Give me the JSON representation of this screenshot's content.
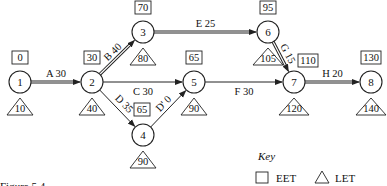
{
  "diagram": {
    "type": "activity-on-arrow network",
    "nodes": [
      {
        "id": "1",
        "label": "1",
        "eet": "0",
        "let": "10",
        "x": 20,
        "y": 82
      },
      {
        "id": "2",
        "label": "2",
        "eet": "30",
        "let": "40",
        "x": 92,
        "y": 82
      },
      {
        "id": "3",
        "label": "3",
        "eet": "70",
        "let": "80",
        "x": 143,
        "y": 32
      },
      {
        "id": "4",
        "label": "4",
        "eet": "65",
        "let": "90",
        "x": 143,
        "y": 135
      },
      {
        "id": "5",
        "label": "5",
        "eet": "65",
        "let": "90",
        "x": 194,
        "y": 82
      },
      {
        "id": "6",
        "label": "6",
        "eet": "95",
        "let": "105",
        "x": 268,
        "y": 32
      },
      {
        "id": "7",
        "label": "7",
        "eet": "110",
        "let": "120",
        "x": 294,
        "y": 82
      },
      {
        "id": "8",
        "label": "8",
        "eet": "130",
        "let": "140",
        "x": 371,
        "y": 82
      }
    ],
    "activities": [
      {
        "from": "1",
        "to": "2",
        "label": "A 30",
        "critical": true
      },
      {
        "from": "2",
        "to": "3",
        "label": "B 40",
        "critical": true
      },
      {
        "from": "2",
        "to": "5",
        "label": "C 30",
        "critical": false
      },
      {
        "from": "2",
        "to": "4",
        "label": "D 35",
        "critical": false
      },
      {
        "from": "3",
        "to": "6",
        "label": "E 25",
        "critical": true
      },
      {
        "from": "4",
        "to": "5",
        "label": "D' 0",
        "critical": false
      },
      {
        "from": "5",
        "to": "7",
        "label": "F 30",
        "critical": false
      },
      {
        "from": "6",
        "to": "7",
        "label": "G 15",
        "critical": true
      },
      {
        "from": "7",
        "to": "8",
        "label": "H 20",
        "critical": true
      }
    ]
  },
  "key": {
    "title": "Key",
    "square_label": "EET",
    "triangle_label": "LET"
  },
  "caption": "Figure 5.4"
}
